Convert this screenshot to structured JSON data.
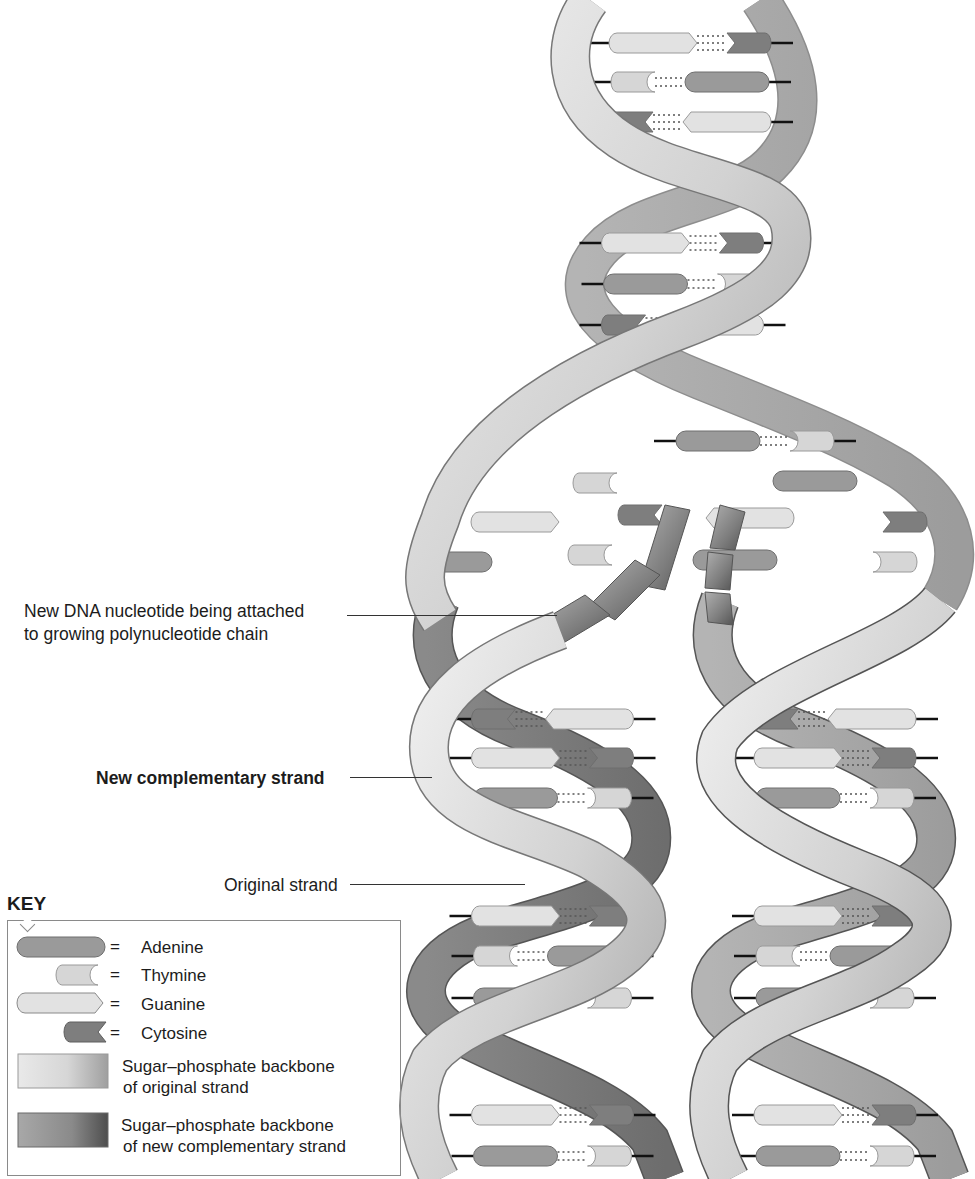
{
  "figure": {
    "colors": {
      "adenine": "#9a9a9a",
      "thymine": "#d6d6d6",
      "guanine": "#e2e2e2",
      "cytosine": "#7e7e7e",
      "original_backbone": "#d8d8d8",
      "new_backbone": "#8c8c8c",
      "outline": "#6e6e6e",
      "hydrogen_bond": "#555555"
    }
  },
  "callouts": {
    "nucleotide_line1": "New DNA nucleotide being attached",
    "nucleotide_line2": "to growing polynucleotide chain",
    "new_strand": "New complementary strand",
    "original_strand": "Original strand"
  },
  "key": {
    "title": "KEY",
    "items": [
      {
        "symbol": "adenine-shape",
        "eq": "=",
        "label": "Adenine"
      },
      {
        "symbol": "thymine-shape",
        "eq": "=",
        "label": "Thymine"
      },
      {
        "symbol": "guanine-shape",
        "eq": "=",
        "label": "Guanine"
      },
      {
        "symbol": "cytosine-shape",
        "eq": "=",
        "label": "Cytosine"
      },
      {
        "symbol": "original-backbone-swatch",
        "label_line1": "Sugar–phosphate backbone",
        "label_line2": "of original strand"
      },
      {
        "symbol": "new-backbone-swatch",
        "label_line1": "Sugar–phosphate backbone",
        "label_line2": "of new complementary strand"
      }
    ]
  },
  "helix": {
    "parent_base_pairs": [
      {
        "y": 43,
        "left": "G",
        "right": "C"
      },
      {
        "y": 82,
        "left": "T",
        "right": "A"
      },
      {
        "y": 122,
        "left": "C",
        "right": "G"
      },
      {
        "y": 243,
        "left": "G",
        "right": "C"
      },
      {
        "y": 284,
        "left": "A",
        "right": "T"
      },
      {
        "y": 325,
        "left": "C",
        "right": "G"
      },
      {
        "y": 441,
        "left": "A",
        "right": "T"
      }
    ],
    "daughter_left_pairs": [
      {
        "y": 719,
        "left": "C",
        "right": "G"
      },
      {
        "y": 758,
        "left": "G",
        "right": "C"
      },
      {
        "y": 798,
        "left": "A",
        "right": "T"
      },
      {
        "y": 916,
        "left": "G",
        "right": "C"
      },
      {
        "y": 956,
        "left": "T",
        "right": "A"
      },
      {
        "y": 998,
        "left": "A",
        "right": "T"
      },
      {
        "y": 1115,
        "left": "G",
        "right": "C"
      },
      {
        "y": 1156,
        "left": "A",
        "right": "T"
      }
    ],
    "daughter_right_pairs": [
      {
        "y": 719,
        "left": "C",
        "right": "G"
      },
      {
        "y": 758,
        "left": "G",
        "right": "C"
      },
      {
        "y": 798,
        "left": "A",
        "right": "T"
      },
      {
        "y": 916,
        "left": "G",
        "right": "C"
      },
      {
        "y": 956,
        "left": "T",
        "right": "A"
      },
      {
        "y": 998,
        "left": "A",
        "right": "T"
      },
      {
        "y": 1115,
        "left": "G",
        "right": "C"
      },
      {
        "y": 1156,
        "left": "A",
        "right": "T"
      }
    ],
    "fork_free_bases": [
      {
        "x": 595,
        "y": 483,
        "base": "T"
      },
      {
        "x": 515,
        "y": 522,
        "base": "G"
      },
      {
        "x": 450,
        "y": 562,
        "base": "A"
      },
      {
        "x": 590,
        "y": 555,
        "base": "T"
      },
      {
        "x": 640,
        "y": 515,
        "base": "C"
      },
      {
        "x": 750,
        "y": 518,
        "base": "G"
      },
      {
        "x": 735,
        "y": 560,
        "base": "A"
      },
      {
        "x": 815,
        "y": 481,
        "base": "A"
      },
      {
        "x": 905,
        "y": 522,
        "base": "C"
      },
      {
        "x": 895,
        "y": 562,
        "base": "T"
      }
    ]
  }
}
